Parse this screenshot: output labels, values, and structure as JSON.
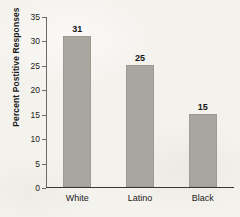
{
  "chart_data": {
    "type": "bar",
    "title": "",
    "xlabel": "",
    "ylabel": "Percent Postitive Responses",
    "categories": [
      "White",
      "Latino",
      "Black"
    ],
    "values": [
      31,
      25,
      15
    ],
    "value_labels": [
      "31",
      "25",
      "15"
    ],
    "ylim": [
      0,
      35
    ],
    "yticks": [
      0,
      5,
      10,
      15,
      20,
      25,
      30,
      35
    ],
    "ytick_labels": [
      "0",
      "5",
      "10",
      "15",
      "20",
      "25",
      "30",
      "35"
    ],
    "grid": false,
    "legend": "none",
    "series": [
      {
        "name": "Percent Postitive Responses",
        "values": [
          31,
          25,
          15
        ]
      }
    ],
    "colors": {
      "bar_fill": "#a9a6a0",
      "bar_stroke": "#9d9a94",
      "axis": "#3a3834",
      "text": "#1b1b1b",
      "background": "#f4f2ed"
    }
  }
}
